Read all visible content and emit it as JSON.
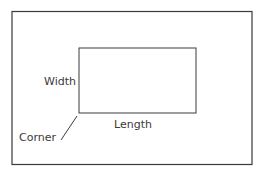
{
  "diagram": {
    "type": "rectangle-annotation",
    "labels": {
      "width": "Width",
      "length": "Length",
      "corner": "Corner"
    },
    "colors": {
      "stroke": "#3a3a3a",
      "text": "#3a3a3a",
      "background": "#ffffff"
    }
  }
}
